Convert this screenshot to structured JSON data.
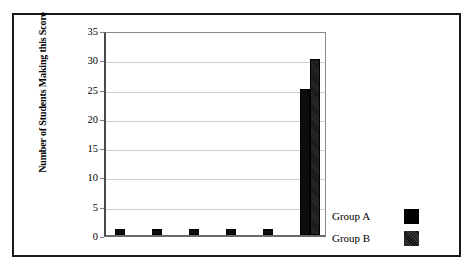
{
  "chart_data": {
    "type": "bar",
    "title": "",
    "xlabel": "",
    "ylabel": "Number of Students Making this Score",
    "ylim": [
      0,
      35
    ],
    "y_ticks": [
      0,
      5,
      10,
      15,
      20,
      25,
      30,
      35
    ],
    "y_tick_labels": [
      "0",
      "5",
      "10",
      "15",
      "20",
      "25",
      "30",
      "35"
    ],
    "grid": true,
    "x_tick_labels": [
      "",
      "",
      "",
      "",
      "",
      ""
    ],
    "categories": [
      "1",
      "2",
      "3",
      "4",
      "5",
      "6"
    ],
    "legend_position": "right",
    "series": [
      {
        "name": "Group A",
        "color": "#000000",
        "values": [
          1,
          1,
          1,
          1,
          1,
          25
        ]
      },
      {
        "name": "Group B",
        "color": "#1f1f1f",
        "values": [
          0,
          0,
          0,
          0,
          0,
          30
        ]
      }
    ]
  },
  "legend": {
    "entries": [
      {
        "label": "Group A",
        "swatch": "solid-black-swatch"
      },
      {
        "label": "Group B",
        "swatch": "textured-dark-swatch"
      }
    ]
  },
  "axis": {
    "y_title": "Number of Students Making this Score",
    "ticks": [
      "35",
      "30",
      "25",
      "20",
      "15",
      "10",
      "5",
      "0"
    ]
  }
}
